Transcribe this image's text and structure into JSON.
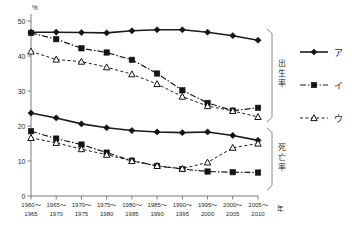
{
  "axes": {
    "y_unit": "%",
    "y_ticks": [
      "50",
      "40",
      "30",
      "20",
      "10",
      "0"
    ],
    "x_unit": "年",
    "x_labels": [
      {
        "top": "1960～",
        "bottom": "1965"
      },
      {
        "top": "1965～",
        "bottom": "1970"
      },
      {
        "top": "1970～",
        "bottom": "1975"
      },
      {
        "top": "1975～",
        "bottom": "1980"
      },
      {
        "top": "1980～",
        "bottom": "1985"
      },
      {
        "top": "1985～",
        "bottom": "1990"
      },
      {
        "top": "1990～",
        "bottom": "1995"
      },
      {
        "top": "1995～",
        "bottom": "2000"
      },
      {
        "top": "2000～",
        "bottom": "2005"
      },
      {
        "top": "2005～",
        "bottom": "2010"
      }
    ]
  },
  "groups": {
    "upper_label": "出生率",
    "lower_label": "死亡率"
  },
  "legend": {
    "items": [
      {
        "key": "a",
        "label": "ア",
        "marker": "filled-diamond",
        "style": "solid"
      },
      {
        "key": "b",
        "label": "イ",
        "marker": "filled-square",
        "style": "dash-dot"
      },
      {
        "key": "c",
        "label": "ウ",
        "marker": "open-triangle",
        "style": "dashed"
      }
    ]
  },
  "chart_data": {
    "type": "line",
    "title": "",
    "xlabel": "年",
    "ylabel": "%",
    "ylim": [
      0,
      50
    ],
    "grid": false,
    "legend_position": "right",
    "categories": [
      "1960～1965",
      "1965～1970",
      "1970～1975",
      "1975～1980",
      "1980～1985",
      "1985～1990",
      "1990～1995",
      "1995～2000",
      "2000～2005",
      "2005～2010"
    ],
    "annotations": [
      "出生率 (birth rate, upper group)",
      "死亡率 (death rate, lower group)"
    ],
    "series": [
      {
        "name": "ア 出生率",
        "group": "出生率",
        "marker": "filled-diamond",
        "style": "solid",
        "values": [
          46.8,
          46.8,
          46.7,
          46.6,
          47.2,
          47.5,
          47.5,
          46.8,
          45.8,
          44.5
        ]
      },
      {
        "name": "イ 出生率",
        "group": "出生率",
        "marker": "filled-square",
        "style": "dash-dot",
        "values": [
          46.6,
          44.8,
          42.2,
          41.0,
          38.9,
          35.0,
          30.2,
          26.6,
          24.4,
          25.2
        ]
      },
      {
        "name": "ウ 出生率",
        "group": "出生率",
        "marker": "open-triangle",
        "style": "dashed",
        "values": [
          41.3,
          39.0,
          38.4,
          36.8,
          34.8,
          32.0,
          28.4,
          25.7,
          24.3,
          22.6
        ]
      },
      {
        "name": "ア 死亡率",
        "group": "死亡率",
        "marker": "filled-diamond",
        "style": "solid",
        "values": [
          23.7,
          22.3,
          20.6,
          19.5,
          18.7,
          18.3,
          18.1,
          18.3,
          17.3,
          15.9
        ]
      },
      {
        "name": "イ 死亡率",
        "group": "死亡率",
        "marker": "filled-square",
        "style": "dash-dot",
        "values": [
          18.5,
          16.4,
          14.7,
          12.4,
          10.1,
          8.6,
          7.7,
          7.0,
          6.8,
          6.7
        ]
      },
      {
        "name": "ウ 死亡率",
        "group": "死亡率",
        "marker": "open-triangle",
        "style": "dashed",
        "values": [
          16.6,
          15.2,
          13.4,
          11.8,
          10.0,
          8.6,
          7.8,
          9.6,
          13.8,
          15.0
        ]
      }
    ]
  }
}
